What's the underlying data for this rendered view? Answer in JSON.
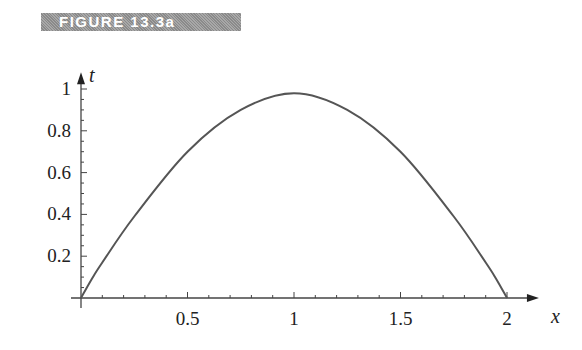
{
  "figure_label": "FIGURE 13.3a",
  "chart_data": {
    "type": "line",
    "title": "FIGURE 13.3a",
    "xlabel": "x",
    "ylabel": "t",
    "xlim": [
      0,
      2.15
    ],
    "ylim": [
      0,
      1.08
    ],
    "grid": false,
    "legend": null,
    "x_ticks": [
      0.5,
      1,
      1.5,
      2
    ],
    "x_tick_labels": [
      "0.5",
      "1",
      "1.5",
      "2"
    ],
    "y_ticks": [
      0.2,
      0.4,
      0.6,
      0.8,
      1
    ],
    "y_tick_labels": [
      "0.2",
      "0.4",
      "0.6",
      "0.8",
      "1"
    ],
    "series": [
      {
        "name": "t(x)",
        "color": "#555555",
        "x": [
          0,
          0.05,
          0.1,
          0.25,
          0.5,
          0.75,
          1,
          1.25,
          1.5,
          1.75,
          1.9,
          1.95,
          2
        ],
        "values": [
          0,
          0.09,
          0.17,
          0.39,
          0.7,
          0.9,
          0.98,
          0.9,
          0.7,
          0.39,
          0.17,
          0.09,
          0
        ]
      }
    ]
  }
}
